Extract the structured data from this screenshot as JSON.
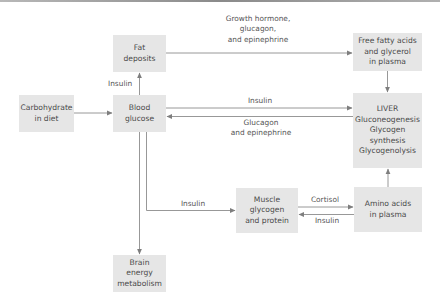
{
  "diagram": {
    "nodes": {
      "carbohydrate": {
        "lines": [
          "Carbohydrate",
          "in diet"
        ]
      },
      "fat": {
        "lines": [
          "Fat",
          "deposits"
        ]
      },
      "blood": {
        "lines": [
          "Blood",
          "glucose"
        ]
      },
      "ffa": {
        "lines": [
          "Free fatty acids",
          "and glycerol",
          "in plasma"
        ]
      },
      "liver": {
        "lines": [
          "LIVER",
          "Gluconeogenesis",
          "Glycogen",
          "synthesis",
          "Glycogenolysis"
        ]
      },
      "muscle": {
        "lines": [
          "Muscle",
          "glycogen",
          "and protein"
        ]
      },
      "amino": {
        "lines": [
          "Amino acids",
          "in plasma"
        ]
      },
      "brain": {
        "lines": [
          "Brain",
          "energy",
          "metabolism"
        ]
      }
    },
    "edge_labels": {
      "fat_to_ffa": [
        "Growth hormone,",
        "glucagon,",
        "and epinephrine"
      ],
      "blood_to_fat": "Insulin",
      "blood_to_liver": "Insulin",
      "liver_to_blood": [
        "Glucagon",
        "and epinephrine"
      ],
      "blood_to_muscle": "Insulin",
      "muscle_to_amino": "Cortisol",
      "amino_to_muscle": "Insulin"
    },
    "colors": {
      "box_fill": "#e6e6e6",
      "text": "#4a4a4a",
      "arrow": "#8c8c8c"
    }
  }
}
